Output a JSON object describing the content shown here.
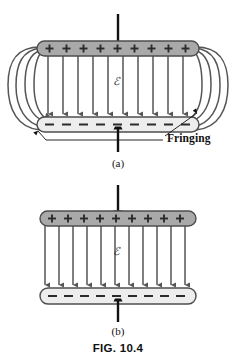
{
  "figure": {
    "caption": "FIG. 10.4",
    "topic": "parallel-plate capacitor electric field",
    "panels": [
      {
        "id": "a",
        "label": "(a)",
        "description": "Real parallel-plate capacitor showing fringing of the electric field at the plate edges",
        "field_symbol": "ℰ",
        "top_plate": {
          "charge_sign": "+",
          "charge_count": 10,
          "charge_row": "+ + + + + + + + + +",
          "fill_color": "#a9a9a9",
          "stroke_color": "#4d4d4d"
        },
        "bottom_plate": {
          "charge_sign": "–",
          "charge_count": 10,
          "charge_row": "– – – – – – – – – –",
          "fill_color": "#ededed",
          "stroke_color": "#4d4d4d"
        },
        "interior_field_lines": 11,
        "fringing_curves_per_side": 3,
        "annotation": {
          "text": "Fringing",
          "leader_count": 2
        }
      },
      {
        "id": "b",
        "label": "(b)",
        "description": "Idealized parallel-plate capacitor with uniform field and no fringing",
        "field_symbol": "ℰ",
        "top_plate": {
          "charge_sign": "+",
          "charge_count": 10,
          "charge_row": "+ + + + + + + + + +",
          "fill_color": "#a9a9a9",
          "stroke_color": "#4d4d4d"
        },
        "bottom_plate": {
          "charge_sign": "–",
          "charge_count": 10,
          "charge_row": "– – – – – – – – – –",
          "fill_color": "#ededed",
          "stroke_color": "#4d4d4d"
        },
        "interior_field_lines": 11,
        "fringing_curves_per_side": 0,
        "annotation": null
      }
    ],
    "terminals": {
      "top_lead": "vertical wire stub entering top plate",
      "bottom_lead": "vertical wire stub leaving bottom plate",
      "color": "#111111"
    },
    "colors": {
      "background": "#ffffff",
      "plate_positive": "#a9a9a9",
      "plate_negative": "#ededed",
      "plate_outline": "#4d4d4d",
      "field_line": "#555555",
      "fringe_line": "#555555",
      "text": "#111111",
      "lead_wire": "#111111"
    }
  }
}
